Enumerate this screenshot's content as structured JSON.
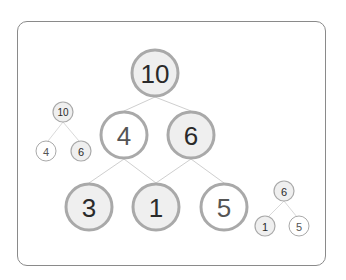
{
  "diagram": {
    "type": "binary-tree-merge",
    "main_tree": {
      "nodes": [
        {
          "id": "root",
          "label": "10",
          "x": 155,
          "y": 73,
          "filled": true
        },
        {
          "id": "l",
          "label": "4",
          "x": 124,
          "y": 135,
          "filled": false
        },
        {
          "id": "r",
          "label": "6",
          "x": 191,
          "y": 135,
          "filled": true
        },
        {
          "id": "ll",
          "label": "3",
          "x": 89,
          "y": 207,
          "filled": true
        },
        {
          "id": "lr",
          "label": "1",
          "x": 156,
          "y": 207,
          "filled": true
        },
        {
          "id": "rr",
          "label": "5",
          "x": 224,
          "y": 207,
          "filled": false
        }
      ]
    },
    "left_small_tree": {
      "nodes": [
        {
          "label": "10",
          "filled": true
        },
        {
          "label": "4",
          "filled": false
        },
        {
          "label": "6",
          "filled": true
        }
      ]
    },
    "right_small_tree": {
      "nodes": [
        {
          "label": "6",
          "filled": true
        },
        {
          "label": "1",
          "filled": true
        },
        {
          "label": "5",
          "filled": false
        }
      ]
    },
    "colors": {
      "filled": "#efefef",
      "empty": "#ffffff",
      "stroke": "#a9a9a9",
      "edge": "#cfcfcf",
      "text": "#2a2a2a",
      "text_light": "#555555",
      "frame": "#8a8a8a"
    }
  }
}
